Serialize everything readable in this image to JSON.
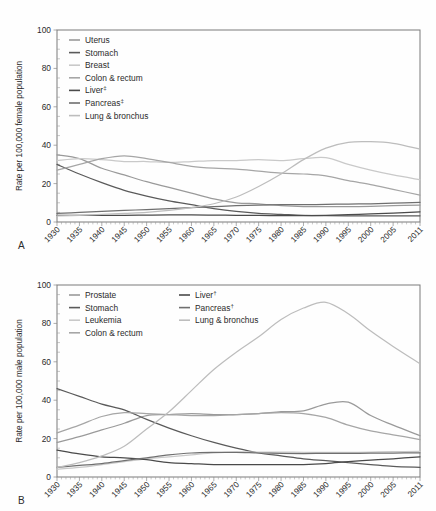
{
  "figure": {
    "panels": [
      {
        "letter": "A",
        "ylabel": "Rate per 100,000 female population",
        "ylim": [
          0,
          100
        ],
        "yticks": [
          0,
          20,
          40,
          60,
          80,
          100
        ],
        "xlim": [
          1930,
          2011
        ],
        "xticks": [
          1930,
          1935,
          1940,
          1945,
          1950,
          1955,
          1960,
          1965,
          1970,
          1975,
          1980,
          1985,
          1990,
          1995,
          2000,
          2005,
          2011
        ],
        "legend_position": "top-left",
        "legend_columns": 1
      },
      {
        "letter": "B",
        "ylabel": "Rate per 100,000 male population",
        "ylim": [
          0,
          100
        ],
        "yticks": [
          0,
          20,
          40,
          60,
          80,
          100
        ],
        "xlim": [
          1930,
          2011
        ],
        "xticks": [
          1930,
          1935,
          1940,
          1945,
          1950,
          1955,
          1960,
          1965,
          1970,
          1975,
          1980,
          1985,
          1990,
          1995,
          2000,
          2005,
          2011
        ],
        "legend_position": "top-left",
        "legend_columns": 2
      }
    ]
  },
  "chart_data": [
    {
      "type": "line",
      "title": "",
      "xlabel": "",
      "ylabel": "Rate per 100,000 female population",
      "xlim": [
        1930,
        2011
      ],
      "ylim": [
        0,
        100
      ],
      "grid": false,
      "legend_position": "top-left",
      "x": [
        1930,
        1935,
        1940,
        1945,
        1950,
        1955,
        1960,
        1965,
        1970,
        1975,
        1980,
        1985,
        1990,
        1995,
        2000,
        2005,
        2011
      ],
      "series": [
        {
          "name": "Uterus",
          "color": "#9a9a9a",
          "values": [
            35.0,
            33.0,
            28.0,
            24.5,
            21.0,
            18.0,
            15.0,
            12.0,
            10.0,
            9.5,
            8.5,
            8.0,
            8.0,
            8.0,
            8.2,
            8.5,
            8.8
          ]
        },
        {
          "name": "Stomach",
          "color": "#5a5a5a",
          "values": [
            30.0,
            25.0,
            20.5,
            16.5,
            13.5,
            11.0,
            9.0,
            7.0,
            5.5,
            4.5,
            4.0,
            3.5,
            3.3,
            3.2,
            3.2,
            3.2,
            3.2
          ]
        },
        {
          "name": "Breast",
          "color": "#c9c9c9",
          "values": [
            32.0,
            33.0,
            32.5,
            31.5,
            31.5,
            31.0,
            31.5,
            32.0,
            32.0,
            32.5,
            32.0,
            33.0,
            33.5,
            30.0,
            27.0,
            24.5,
            22.0
          ]
        },
        {
          "name": "Colon & rectum",
          "color": "#a6a6a6",
          "values": [
            27.0,
            30.0,
            33.0,
            34.5,
            33.0,
            31.0,
            29.0,
            28.0,
            27.5,
            26.5,
            25.5,
            25.0,
            24.0,
            21.5,
            19.5,
            17.0,
            14.0
          ]
        },
        {
          "name": "Liver‡",
          "color": "#4a4a4a",
          "values": [
            3.5,
            3.5,
            3.5,
            3.5,
            3.6,
            3.7,
            3.7,
            3.6,
            3.5,
            3.4,
            3.3,
            3.3,
            3.5,
            3.8,
            4.2,
            4.6,
            5.3
          ]
        },
        {
          "name": "Pancreas‡",
          "color": "#6f6f6f",
          "values": [
            4.5,
            5.0,
            5.5,
            6.0,
            6.5,
            7.0,
            7.5,
            8.0,
            8.5,
            8.8,
            9.0,
            9.0,
            9.2,
            9.3,
            9.5,
            9.8,
            10.2
          ]
        },
        {
          "name": "Lung & bronchus",
          "color": "#bdbdbd",
          "values": [
            3.2,
            3.5,
            4.0,
            4.5,
            5.0,
            6.0,
            7.5,
            9.5,
            13.0,
            18.5,
            25.0,
            32.5,
            38.5,
            41.5,
            41.8,
            41.0,
            38.0
          ]
        }
      ]
    },
    {
      "type": "line",
      "title": "",
      "xlabel": "",
      "ylabel": "Rate per 100,000 male population",
      "xlim": [
        1930,
        2011
      ],
      "ylim": [
        0,
        100
      ],
      "grid": false,
      "legend_position": "top-left",
      "x": [
        1930,
        1935,
        1940,
        1945,
        1950,
        1955,
        1960,
        1965,
        1970,
        1975,
        1980,
        1985,
        1990,
        1995,
        2000,
        2005,
        2011
      ],
      "series": [
        {
          "name": "Prostate",
          "color": "#9a9a9a",
          "values": [
            18.0,
            21.0,
            24.5,
            28.0,
            32.0,
            32.5,
            33.0,
            32.5,
            32.5,
            33.0,
            34.0,
            34.5,
            38.0,
            39.0,
            32.0,
            27.0,
            21.5
          ]
        },
        {
          "name": "Stomach",
          "color": "#5a5a5a",
          "values": [
            46.0,
            42.0,
            38.0,
            35.0,
            30.0,
            25.5,
            21.5,
            18.0,
            15.0,
            12.5,
            11.0,
            9.5,
            8.5,
            7.5,
            6.5,
            5.5,
            5.0
          ]
        },
        {
          "name": "Leukemia",
          "color": "#c9c9c9",
          "values": [
            4.0,
            5.0,
            6.5,
            8.0,
            9.5,
            10.5,
            11.5,
            12.5,
            13.0,
            13.0,
            13.0,
            12.8,
            12.8,
            12.8,
            13.0,
            13.2,
            13.3
          ]
        },
        {
          "name": "Colon & rectum",
          "color": "#a6a6a6",
          "values": [
            23.0,
            27.0,
            31.5,
            33.5,
            33.0,
            32.5,
            32.0,
            32.0,
            32.5,
            33.0,
            33.5,
            33.0,
            31.0,
            27.0,
            24.0,
            22.0,
            19.5
          ]
        },
        {
          "name": "Liver†",
          "color": "#4a4a4a",
          "values": [
            14.0,
            12.0,
            10.5,
            10.0,
            9.0,
            7.5,
            7.0,
            6.5,
            6.5,
            6.5,
            6.5,
            6.5,
            7.0,
            8.0,
            8.8,
            9.5,
            10.5
          ]
        },
        {
          "name": "Pancreas†",
          "color": "#6f6f6f",
          "values": [
            5.0,
            6.0,
            7.0,
            8.5,
            10.0,
            11.5,
            12.5,
            12.8,
            12.8,
            12.5,
            12.3,
            12.2,
            12.3,
            12.3,
            12.4,
            12.5,
            12.6
          ]
        },
        {
          "name": "Lung & bronchus",
          "color": "#bdbdbd",
          "values": [
            5.0,
            7.5,
            11.0,
            16.0,
            25.0,
            34.0,
            45.0,
            56.0,
            65.0,
            73.0,
            82.0,
            88.0,
            91.0,
            85.0,
            76.0,
            68.0,
            59.0
          ]
        }
      ]
    }
  ]
}
